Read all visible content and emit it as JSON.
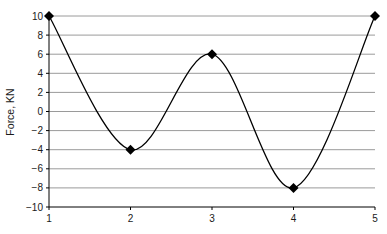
{
  "chart_data": {
    "type": "line",
    "title": "",
    "xlabel": "",
    "ylabel": "Force, KN",
    "x": [
      1,
      2,
      3,
      4,
      5
    ],
    "series": [
      {
        "name": "Force",
        "values": [
          10,
          -4,
          6,
          -8,
          10
        ],
        "marker": "diamond",
        "smooth": true,
        "color": "#000000"
      }
    ],
    "x_ticks": [
      "1",
      "2",
      "3",
      "4",
      "5"
    ],
    "y_ticks": [
      "10",
      "8",
      "6",
      "4",
      "2",
      "0",
      "-2",
      "-4",
      "-6",
      "-8",
      "-10"
    ],
    "xlim": [
      1,
      5
    ],
    "ylim": [
      -10,
      10
    ],
    "grid": {
      "horizontal": true,
      "vertical": false,
      "color": "#9a9a9a"
    },
    "legend": null
  }
}
